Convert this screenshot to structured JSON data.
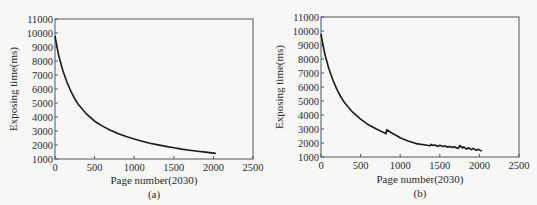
{
  "chart_data": [
    {
      "type": "line",
      "panel_label": "(a)",
      "title": "",
      "xlabel": "Page number(2030)",
      "ylabel": "Exposing time(ms)",
      "xlim": [
        0,
        2500
      ],
      "ylim": [
        1000,
        11000
      ],
      "xticks": [
        0,
        500,
        1000,
        1500,
        2000,
        2500
      ],
      "yticks": [
        1000,
        2000,
        3000,
        4000,
        5000,
        6000,
        7000,
        8000,
        9000,
        10000,
        11000
      ],
      "grid": false,
      "series": [
        {
          "name": "Exposing time",
          "x": [
            0,
            25,
            50,
            100,
            150,
            200,
            250,
            300,
            400,
            500,
            600,
            700,
            800,
            900,
            1000,
            1100,
            1200,
            1300,
            1400,
            1500,
            1600,
            1700,
            1800,
            1900,
            2000,
            2030
          ],
          "y": [
            9800,
            9000,
            8300,
            7300,
            6500,
            5850,
            5300,
            4850,
            4200,
            3700,
            3350,
            3050,
            2800,
            2600,
            2420,
            2270,
            2130,
            2010,
            1900,
            1800,
            1710,
            1630,
            1560,
            1490,
            1420,
            1400
          ]
        }
      ]
    },
    {
      "type": "line",
      "panel_label": "(b)",
      "title": "",
      "xlabel": "Page number(2030)",
      "ylabel": "Exposing time(ms)",
      "xlim": [
        0,
        2500
      ],
      "ylim": [
        1000,
        11000
      ],
      "xticks": [
        0,
        500,
        1000,
        1500,
        2000,
        2500
      ],
      "yticks": [
        1000,
        2000,
        3000,
        4000,
        5000,
        6000,
        7000,
        8000,
        9000,
        10000,
        11000
      ],
      "grid": false,
      "series": [
        {
          "name": "Exposing time",
          "x": [
            0,
            25,
            50,
            100,
            150,
            200,
            250,
            300,
            400,
            500,
            600,
            700,
            800,
            820,
            830,
            900,
            1000,
            1100,
            1200,
            1300,
            1380,
            1390,
            1420,
            1440,
            1480,
            1500,
            1540,
            1560,
            1600,
            1620,
            1660,
            1680,
            1720,
            1740,
            1750,
            1790,
            1800,
            1840,
            1860,
            1900,
            1920,
            1960,
            1980,
            2030
          ],
          "y": [
            9800,
            9000,
            8300,
            7300,
            6500,
            5850,
            5300,
            4850,
            4200,
            3700,
            3300,
            3000,
            2720,
            2650,
            2950,
            2700,
            2380,
            2150,
            1960,
            1880,
            1800,
            1900,
            1820,
            1860,
            1760,
            1840,
            1740,
            1800,
            1700,
            1760,
            1680,
            1730,
            1620,
            1650,
            1820,
            1640,
            1720,
            1560,
            1660,
            1530,
            1620,
            1480,
            1560,
            1420
          ]
        }
      ]
    }
  ],
  "panels": {
    "a": {
      "caption": "(a)",
      "xlabel": "Page number(2030)",
      "ylabel": "Exposing time(ms)",
      "xtick_labels": [
        "0",
        "500",
        "1000",
        "1500",
        "2000",
        "2500"
      ],
      "ytick_labels": [
        "1000",
        "2000",
        "3000",
        "4000",
        "5000",
        "6000",
        "7000",
        "8000",
        "9000",
        "10000",
        "11000"
      ]
    },
    "b": {
      "caption": "(b)",
      "xlabel": "Page number(2030)",
      "ylabel": "Exposing time(ms)",
      "xtick_labels": [
        "0",
        "500",
        "1000",
        "1500",
        "2000",
        "2500"
      ],
      "ytick_labels": [
        "1000",
        "2000",
        "3000",
        "4000",
        "5000",
        "6000",
        "7000",
        "8000",
        "9000",
        "10000",
        "11000"
      ]
    }
  }
}
